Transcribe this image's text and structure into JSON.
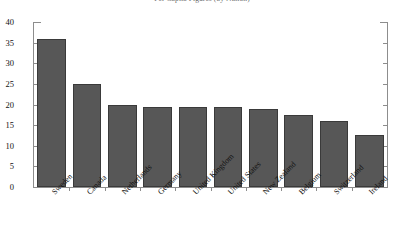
{
  "chart_data": {
    "type": "bar",
    "title": "Per Capita Figures (by Nation)",
    "xlabel": "",
    "ylabel": "",
    "ylim": [
      0,
      40
    ],
    "yticks": [
      0,
      5,
      10,
      15,
      20,
      25,
      30,
      35,
      40
    ],
    "ytick_labels": [
      "0",
      "5",
      "10",
      "15",
      "20",
      "25",
      "30",
      "35",
      "40"
    ],
    "grid": false,
    "legend": false,
    "orientation": "vertical",
    "bar_color": "#575757",
    "bar_edge_color": "#3a3a3a",
    "axis_color": "#8d8d8d",
    "background_color": "#ffffff",
    "categories": [
      "Sweden",
      "Canada",
      "Netherlands",
      "Germany",
      "United Kingdom",
      "United States",
      "New Zealand",
      "Belgium",
      "Switzerland",
      "Ireland"
    ],
    "values": [
      36,
      25,
      20,
      19.5,
      19.5,
      19.5,
      19,
      17.5,
      16,
      12.5
    ]
  }
}
